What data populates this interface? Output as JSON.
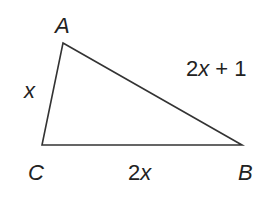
{
  "figure": {
    "type": "triangle",
    "stroke_color": "#333333",
    "text_color": "#222222",
    "vertices": {
      "A": {
        "label": "A",
        "x": 63,
        "y": 43
      },
      "B": {
        "label": "B",
        "x": 242,
        "y": 145
      },
      "C": {
        "label": "C",
        "x": 42,
        "y": 145
      }
    },
    "sides": {
      "AC": {
        "label": "x"
      },
      "AB": {
        "label_coef": "2",
        "label_var": "x",
        "label_rest": " + 1"
      },
      "CB": {
        "label_coef": "2",
        "label_var": "x"
      }
    }
  }
}
